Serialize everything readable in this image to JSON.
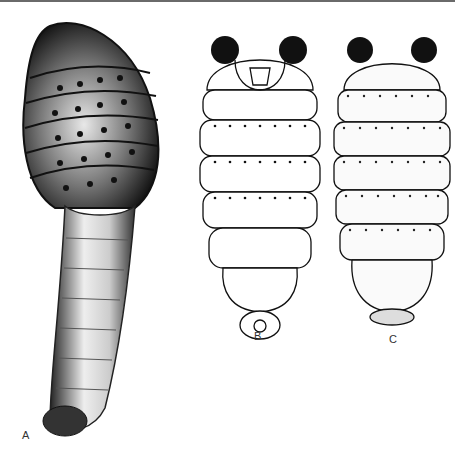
{
  "figure": {
    "panels": [
      {
        "id": "A",
        "label": "A",
        "description": "larva lateral view, dark spiny anterior segments with long tapering posterior tail"
      },
      {
        "id": "B",
        "label": "B",
        "description": "larva ventral view with posterior spiracle tufts and mouthparts"
      },
      {
        "id": "C",
        "label": "C",
        "description": "larva dorsal view with spiracle tufts and stippled segments"
      }
    ]
  },
  "colors": {
    "ink": "#111111",
    "background": "#ffffff",
    "rule": "#6a6a6a"
  }
}
